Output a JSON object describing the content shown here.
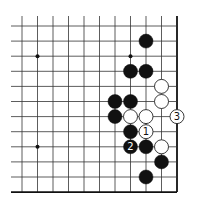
{
  "diagram": {
    "type": "go-board-fragment",
    "grid": {
      "columns": 11,
      "rows": 12,
      "origin_x": 22,
      "origin_y": 26,
      "spacing_x": 15.5,
      "spacing_y": 15.1,
      "line_start_x": 11,
      "line_start_y": 16,
      "right_edge": true,
      "bottom_edge": true,
      "line_color": "#333333",
      "edge_color": "#111111"
    },
    "hoshi": [
      {
        "col": 1,
        "row": 2
      },
      {
        "col": 7,
        "row": 2
      },
      {
        "col": 1,
        "row": 8
      }
    ],
    "stones": [
      {
        "color": "black",
        "col": 8,
        "row": 1,
        "label": ""
      },
      {
        "color": "black",
        "col": 7,
        "row": 3,
        "label": ""
      },
      {
        "color": "black",
        "col": 8,
        "row": 3,
        "label": ""
      },
      {
        "color": "white",
        "col": 9,
        "row": 4,
        "label": ""
      },
      {
        "color": "black",
        "col": 6,
        "row": 5,
        "label": ""
      },
      {
        "color": "black",
        "col": 7,
        "row": 5,
        "label": ""
      },
      {
        "color": "white",
        "col": 9,
        "row": 5,
        "label": ""
      },
      {
        "color": "black",
        "col": 6,
        "row": 6,
        "label": ""
      },
      {
        "color": "white",
        "col": 7,
        "row": 6,
        "label": ""
      },
      {
        "color": "white",
        "col": 8,
        "row": 6,
        "label": ""
      },
      {
        "color": "white",
        "col": 10,
        "row": 6,
        "label": "3"
      },
      {
        "color": "black",
        "col": 7,
        "row": 7,
        "label": ""
      },
      {
        "color": "white",
        "col": 8,
        "row": 7,
        "label": "1"
      },
      {
        "color": "black",
        "col": 7,
        "row": 8,
        "label": "2"
      },
      {
        "color": "black",
        "col": 8,
        "row": 8,
        "label": ""
      },
      {
        "color": "white",
        "col": 9,
        "row": 8,
        "label": ""
      },
      {
        "color": "black",
        "col": 9,
        "row": 9,
        "label": ""
      },
      {
        "color": "black",
        "col": 8,
        "row": 10,
        "label": ""
      }
    ],
    "colors": {
      "black_stone": "#111111",
      "white_stone": "#ffffff",
      "white_stone_border": "#222222",
      "black_label": "#ffffff",
      "white_label": "#111111"
    }
  }
}
